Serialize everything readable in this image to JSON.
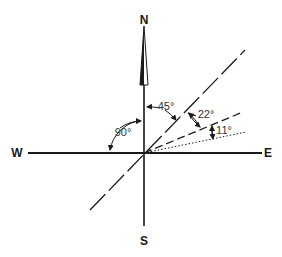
{
  "compass": {
    "north": "N",
    "south": "S",
    "east": "E",
    "west": "W"
  },
  "angles": {
    "north_to_west": "90°",
    "north_to_line45": "45°",
    "line45_to_line22": "22°",
    "line22_to_line11": "11°"
  },
  "colors": {
    "ink": "#1a1a1a",
    "background": "#ffffff"
  }
}
